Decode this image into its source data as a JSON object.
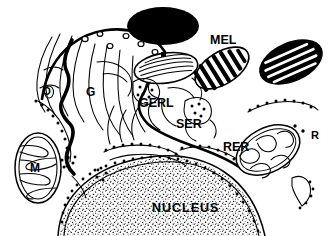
{
  "figure": {
    "background_color": "#ffffff",
    "ink_color": "#000000",
    "width_px": 334,
    "height_px": 236
  },
  "labels": {
    "mel": "MEL",
    "gerl": "GERL",
    "ser": "SER",
    "rer": "RER",
    "nucleus": "NUCLEUS",
    "golgi": "G",
    "mitochondrion": "M",
    "ribosomes": "R",
    "other": "O"
  },
  "label_meanings": {
    "mel": "melanosome",
    "gerl": "Golgi endoplasmic reticulum lysosome",
    "ser": "smooth endoplasmic reticulum",
    "rer": "rough endoplasmic reticulum",
    "nucleus": "nucleus",
    "golgi": "Golgi apparatus",
    "mitochondrion": "mitochondrion",
    "ribosomes": "free ribosomes",
    "other": "coated vesicle region"
  },
  "structures": [
    {
      "name": "melanosome-stage-iv-solid",
      "appearance": "solid black ellipse",
      "position": "top center"
    },
    {
      "name": "melanosome-stage-ii-striated",
      "appearance": "outlined ellipse with fine parallel striations",
      "position": "upper center"
    },
    {
      "name": "melanosome-stage-iii-mel",
      "appearance": "ellipse with thick black longitudinal stripes",
      "position": "upper right, labeled MEL"
    },
    {
      "name": "melanosome-stage-iv-dark",
      "appearance": "black ellipse with white striations",
      "position": "top right"
    },
    {
      "name": "mitochondrion-left",
      "appearance": "ellipse with folded cristae, labeled M",
      "position": "left"
    },
    {
      "name": "mitochondrion-right",
      "appearance": "ellipse with folded cristae",
      "position": "right"
    },
    {
      "name": "golgi-stacks",
      "appearance": "stacked curved cisternae, labeled G",
      "position": "left of center"
    },
    {
      "name": "gerl-region",
      "appearance": "vesicles with dense granules, labeled GERL",
      "position": "center"
    },
    {
      "name": "ser-region",
      "appearance": "smooth tubule with dotted vesicle, labeled SER",
      "position": "center right"
    },
    {
      "name": "rer-cisternae",
      "appearance": "membranes studded with ribosome dots, labeled RER",
      "position": "lower center"
    },
    {
      "name": "free-ribosomes",
      "appearance": "scattered dots, labeled R",
      "position": "right"
    },
    {
      "name": "nucleus",
      "appearance": "large dome with stippled chromatin, labeled NUCLEUS",
      "position": "bottom"
    },
    {
      "name": "cell-membrane",
      "appearance": "curved boundary with coated vesicles",
      "position": "top left arc"
    }
  ]
}
